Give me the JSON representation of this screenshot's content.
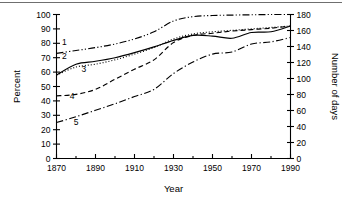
{
  "chart_data": {
    "type": "line",
    "title": "",
    "subtitle": "",
    "xlabel": "Year",
    "ylabel": "Percent",
    "y2label": "Number of days",
    "xlim": [
      1870,
      1990
    ],
    "ylim": [
      0,
      100
    ],
    "y2lim": [
      0,
      180
    ],
    "grid": false,
    "legend_position": "inline-curve-labels",
    "x_ticks": [
      1870,
      1890,
      1910,
      1930,
      1950,
      1970,
      1990
    ],
    "x_minor_ticks": [
      1880,
      1900,
      1920,
      1940,
      1960,
      1980
    ],
    "x_tick_labels": [
      "1870",
      "1890",
      "1910",
      "1930",
      "1950",
      "1970",
      "1990"
    ],
    "y_ticks": [
      0,
      10,
      20,
      30,
      40,
      50,
      60,
      70,
      80,
      90,
      100
    ],
    "y_tick_labels": [
      "0",
      "10",
      "20",
      "30",
      "40",
      "50",
      "60",
      "70",
      "80",
      "90",
      "100"
    ],
    "y2_ticks": [
      0,
      20,
      40,
      60,
      80,
      100,
      120,
      140,
      160,
      180
    ],
    "y2_tick_labels": [
      "0",
      "20",
      "40",
      "60",
      "80",
      "100",
      "120",
      "140",
      "160",
      "180"
    ],
    "x": [
      1870,
      1880,
      1890,
      1900,
      1910,
      1920,
      1930,
      1940,
      1950,
      1960,
      1970,
      1980,
      1990
    ],
    "series": [
      {
        "name": "1",
        "label": "1",
        "axis": "left",
        "style": "dash-dot-dot",
        "label_x": 1874,
        "label_y": 79,
        "values": [
          73.0,
          75.0,
          77.0,
          79.5,
          83.0,
          88.0,
          95.5,
          98.5,
          99.3,
          99.6,
          99.8,
          100.0,
          100.0
        ]
      },
      {
        "name": "2",
        "label": "2",
        "axis": "left",
        "style": "solid",
        "label_x": 1874,
        "label_y": 69,
        "values": [
          58.0,
          65.5,
          67.5,
          70.0,
          73.5,
          77.5,
          82.0,
          85.5,
          85.0,
          83.5,
          87.5,
          88.0,
          92.0
        ]
      },
      {
        "name": "3",
        "label": "3",
        "axis": "left",
        "style": "dotted",
        "label_x": 1884,
        "label_y": 60,
        "values": [
          58.0,
          63.5,
          65.5,
          68.5,
          72.5,
          77.0,
          83.0,
          86.5,
          88.0,
          89.0,
          90.0,
          91.0,
          92.0
        ]
      },
      {
        "name": "4",
        "label": "4",
        "axis": "left",
        "style": "dashed",
        "label_x": 1878,
        "label_y": 41,
        "values": [
          43.5,
          44.5,
          48.0,
          55.0,
          62.0,
          68.5,
          80.5,
          85.5,
          87.0,
          88.5,
          89.5,
          90.5,
          92.0
        ]
      },
      {
        "name": "5",
        "label": "5",
        "axis": "left",
        "style": "dash-dot",
        "label_x": 1880,
        "label_y": 23,
        "values": [
          25.0,
          29.0,
          33.5,
          38.0,
          43.0,
          48.0,
          59.0,
          67.0,
          72.5,
          74.0,
          79.5,
          81.0,
          84.0
        ]
      }
    ]
  },
  "axes": {
    "left_title": "Percent",
    "right_title": "Number of days",
    "bottom_title": "Year"
  }
}
